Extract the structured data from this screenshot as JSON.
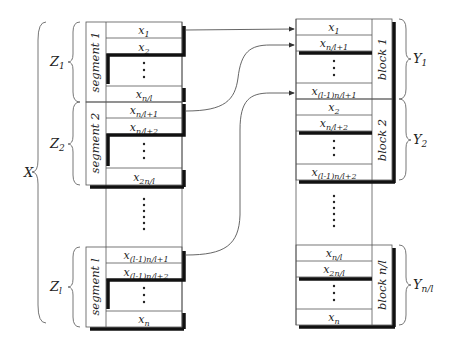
{
  "left": {
    "brace_label": "X",
    "groups": [
      {
        "brace_label": "Z1",
        "segment_label": "segment 1",
        "cells": [
          "x1",
          "x2",
          "⋮",
          "xn/l"
        ]
      },
      {
        "brace_label": "Z2",
        "segment_label": "segment 2",
        "cells": [
          "xn/l+1",
          "xn/l+2",
          "⋮",
          "x2n/l"
        ]
      },
      {
        "brace_label": "Zl",
        "segment_label": "segment l",
        "cells": [
          "x(l-1)n/l+1",
          "x(l-1)n/l+2",
          "⋮",
          "xn"
        ]
      }
    ],
    "gap_dots": "......"
  },
  "right": {
    "groups": [
      {
        "brace_label": "Y1",
        "block_label": "block 1",
        "cells": [
          "x1",
          "xn/l+1",
          "⋮",
          "x(l-1)n/l+1"
        ]
      },
      {
        "brace_label": "Y2",
        "block_label": "block 2",
        "cells": [
          "x2",
          "xn/l+2",
          "⋮",
          "x(l-1)n/l+2"
        ]
      },
      {
        "brace_label": "Yn/l",
        "block_label": "block n/l",
        "cells": [
          "xn/l",
          "x2n/l",
          "⋮",
          "xn"
        ]
      }
    ],
    "gap_dots": "......"
  },
  "render": {
    "X": {
      "base": "X",
      "sub": ""
    },
    "Z1": {
      "base": "Z",
      "sub": "1"
    },
    "Z2": {
      "base": "Z",
      "sub": "2"
    },
    "Zl": {
      "base": "Z",
      "sub": "l"
    },
    "Y1": {
      "base": "Y",
      "sub": "1"
    },
    "Y2": {
      "base": "Y",
      "sub": "2"
    },
    "Yn": {
      "base": "Y",
      "sub": "n/l"
    },
    "L": {
      "c0": {
        "base": "x",
        "sub": "1"
      },
      "c1": {
        "base": "x",
        "sub": "2"
      },
      "c2": {
        "base": "x",
        "sub": "n/l"
      },
      "c3": {
        "base": "x",
        "sub": "n/l+1"
      },
      "c4": {
        "base": "x",
        "sub": "n/l+2"
      },
      "c5": {
        "base": "x",
        "sub": "2n/l"
      },
      "c6": {
        "base": "x",
        "sub": "(l-1)n/l+1"
      },
      "c7": {
        "base": "x",
        "sub": "(l-1)n/l+2"
      },
      "c8": {
        "base": "x",
        "sub": "n"
      }
    },
    "R": {
      "c0": {
        "base": "x",
        "sub": "1"
      },
      "c1": {
        "base": "x",
        "sub": "n/l+1"
      },
      "c2": {
        "base": "x",
        "sub": "(l-1)n/l+1"
      },
      "c3": {
        "base": "x",
        "sub": "2"
      },
      "c4": {
        "base": "x",
        "sub": "n/l+2"
      },
      "c5": {
        "base": "x",
        "sub": "(l-1)n/l+2"
      },
      "c6": {
        "base": "x",
        "sub": "n/l"
      },
      "c7": {
        "base": "x",
        "sub": "2n/l"
      },
      "c8": {
        "base": "x",
        "sub": "n"
      }
    },
    "seg": [
      "segment 1",
      "segment 2",
      "segment l"
    ],
    "blk": [
      "block 1",
      "block 2",
      "block n/l"
    ]
  },
  "arrows": [
    {
      "from": "x1 (segment 1)",
      "to": "x1 (block 1)"
    },
    {
      "from": "xn/l+1 (segment 2)",
      "to": "xn/l+1 (block 1)"
    },
    {
      "from": "x(l-1)n/l+1 (segment l)",
      "to": "x(l-1)n/l+1 (block 1)"
    }
  ]
}
